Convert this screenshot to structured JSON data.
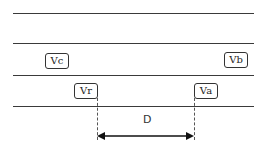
{
  "diagram": {
    "type": "lane-change gap diagram",
    "lane_lines": [
      13,
      43,
      75,
      106
    ],
    "vehicles": [
      {
        "id": "vc",
        "label": "Vc",
        "lane": "upper",
        "x": 45,
        "y": 53
      },
      {
        "id": "vb",
        "label": "Vb",
        "lane": "upper",
        "x": 224,
        "y": 52
      },
      {
        "id": "vr",
        "label": "Vr",
        "lane": "lower",
        "x": 74,
        "y": 83
      },
      {
        "id": "va",
        "label": "Va",
        "lane": "lower",
        "x": 194,
        "y": 83
      }
    ],
    "distance": {
      "label": "D",
      "from": "Vr",
      "to": "Va",
      "x_start": 97,
      "x_end": 194,
      "y": 136
    },
    "colors": {
      "line": "#3a3a3a",
      "box_border": "#333333",
      "text": "#222222"
    }
  }
}
